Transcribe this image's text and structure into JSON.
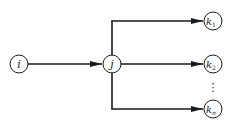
{
  "diagram": {
    "type": "directed-graph",
    "nodes": [
      {
        "id": "i",
        "label": "i",
        "sub": "",
        "x": 19,
        "y": 64
      },
      {
        "id": "j",
        "label": "j",
        "sub": "",
        "x": 112,
        "y": 64
      },
      {
        "id": "k1",
        "label": "k",
        "sub": "1",
        "x": 213,
        "y": 21
      },
      {
        "id": "k2",
        "label": "k",
        "sub": "2",
        "x": 213,
        "y": 64
      },
      {
        "id": "kn",
        "label": "k",
        "sub": "n",
        "x": 213,
        "y": 109
      }
    ],
    "edges": [
      {
        "from": "i",
        "to": "j"
      },
      {
        "from": "j",
        "to": "k1"
      },
      {
        "from": "j",
        "to": "k2"
      },
      {
        "from": "j",
        "to": "kn"
      }
    ],
    "ellipsis": "⋮",
    "colors": {
      "stroke": "#1a1a1a",
      "fill": "#ffffff"
    }
  }
}
